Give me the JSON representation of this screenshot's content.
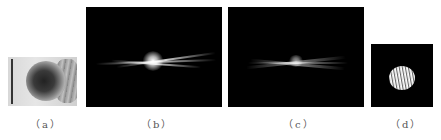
{
  "figure": {
    "panels": [
      {
        "id": "a",
        "label": "（a）",
        "content": "photo of lens/optical component"
      },
      {
        "id": "b",
        "label": "（b）",
        "content": "bright horizontal light streak on black background"
      },
      {
        "id": "c",
        "label": "（c）",
        "content": "diffuse horizontal light streaks on black background"
      },
      {
        "id": "d",
        "label": "（d）",
        "content": "circular striped bright disc on black background"
      }
    ],
    "caption": "图"
  }
}
